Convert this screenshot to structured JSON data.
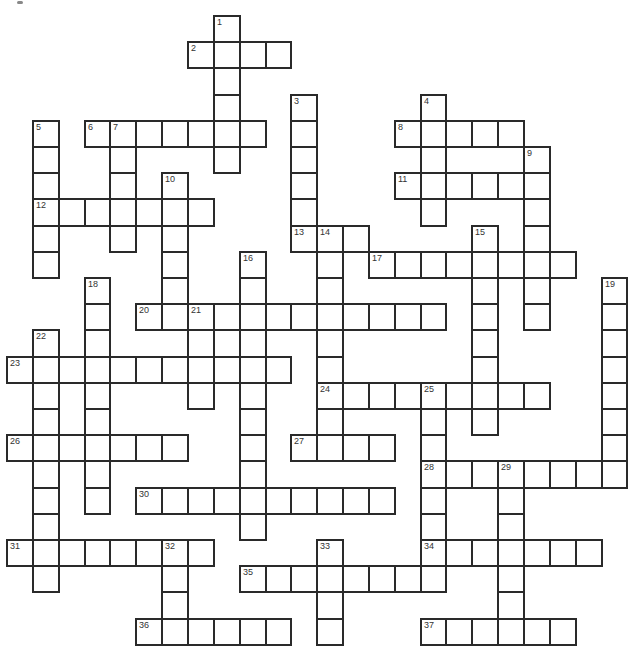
{
  "puzzle": {
    "type": "crossword",
    "grid": {
      "origin_x": 6,
      "origin_y": 15,
      "cell_w": 25.85,
      "cell_h": 26.2,
      "rows": 24,
      "cols": 24
    },
    "colors": {
      "border": "#2a2a2a",
      "cell": "#ffffff",
      "number": "#333333"
    },
    "words": [
      {
        "num": 1,
        "dir": "down",
        "row": 0,
        "col": 8,
        "len": 6
      },
      {
        "num": 2,
        "dir": "across",
        "row": 1,
        "col": 7,
        "len": 4
      },
      {
        "num": 3,
        "dir": "down",
        "row": 3,
        "col": 11,
        "len": 6
      },
      {
        "num": 4,
        "dir": "down",
        "row": 3,
        "col": 16,
        "len": 5
      },
      {
        "num": 5,
        "dir": "down",
        "row": 4,
        "col": 1,
        "len": 6
      },
      {
        "num": 6,
        "dir": "across",
        "row": 4,
        "col": 3,
        "len": 7
      },
      {
        "num": 7,
        "dir": "down",
        "row": 4,
        "col": 4,
        "len": 5
      },
      {
        "num": 8,
        "dir": "across",
        "row": 4,
        "col": 15,
        "len": 5
      },
      {
        "num": 9,
        "dir": "down",
        "row": 5,
        "col": 20,
        "len": 7
      },
      {
        "num": 10,
        "dir": "down",
        "row": 6,
        "col": 6,
        "len": 6
      },
      {
        "num": 11,
        "dir": "across",
        "row": 6,
        "col": 15,
        "len": 6
      },
      {
        "num": 12,
        "dir": "across",
        "row": 7,
        "col": 1,
        "len": 7
      },
      {
        "num": 13,
        "dir": "across",
        "row": 8,
        "col": 11,
        "len": 3
      },
      {
        "num": 14,
        "dir": "down",
        "row": 8,
        "col": 12,
        "len": 9
      },
      {
        "num": 15,
        "dir": "down",
        "row": 8,
        "col": 18,
        "len": 8
      },
      {
        "num": 16,
        "dir": "down",
        "row": 9,
        "col": 9,
        "len": 11
      },
      {
        "num": 17,
        "dir": "across",
        "row": 9,
        "col": 14,
        "len": 8
      },
      {
        "num": 18,
        "dir": "down",
        "row": 10,
        "col": 3,
        "len": 9
      },
      {
        "num": 19,
        "dir": "down",
        "row": 10,
        "col": 23,
        "len": 8
      },
      {
        "num": 20,
        "dir": "across",
        "row": 11,
        "col": 5,
        "len": 12
      },
      {
        "num": 21,
        "dir": "down",
        "row": 11,
        "col": 7,
        "len": 4
      },
      {
        "num": 22,
        "dir": "down",
        "row": 12,
        "col": 1,
        "len": 10
      },
      {
        "num": 23,
        "dir": "across",
        "row": 13,
        "col": 0,
        "len": 11
      },
      {
        "num": 24,
        "dir": "across",
        "row": 14,
        "col": 12,
        "len": 9
      },
      {
        "num": 25,
        "dir": "down",
        "row": 14,
        "col": 16,
        "len": 8
      },
      {
        "num": 26,
        "dir": "across",
        "row": 16,
        "col": 0,
        "len": 7
      },
      {
        "num": 27,
        "dir": "across",
        "row": 16,
        "col": 11,
        "len": 4
      },
      {
        "num": 28,
        "dir": "across",
        "row": 17,
        "col": 16,
        "len": 8
      },
      {
        "num": 29,
        "dir": "down",
        "row": 17,
        "col": 19,
        "len": 7
      },
      {
        "num": 30,
        "dir": "across",
        "row": 18,
        "col": 5,
        "len": 10
      },
      {
        "num": 31,
        "dir": "across",
        "row": 20,
        "col": 0,
        "len": 8
      },
      {
        "num": 32,
        "dir": "down",
        "row": 20,
        "col": 6,
        "len": 4
      },
      {
        "num": 33,
        "dir": "down",
        "row": 20,
        "col": 12,
        "len": 4
      },
      {
        "num": 34,
        "dir": "across",
        "row": 20,
        "col": 16,
        "len": 7
      },
      {
        "num": 35,
        "dir": "across",
        "row": 21,
        "col": 9,
        "len": 8
      },
      {
        "num": 36,
        "dir": "across",
        "row": 23,
        "col": 5,
        "len": 6
      },
      {
        "num": 37,
        "dir": "across",
        "row": 23,
        "col": 16,
        "len": 6
      }
    ]
  }
}
